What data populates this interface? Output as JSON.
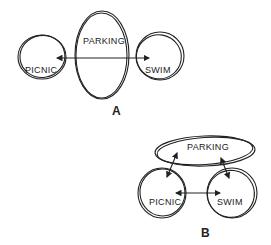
{
  "diagram_a": {
    "label": "A",
    "nodes": {
      "picnic": "PICNIC",
      "parking": "PARKING",
      "swim": "SWIM"
    },
    "connections": [
      {
        "from": "picnic",
        "to": "swim",
        "type": "bidirectional",
        "through": "parking"
      }
    ]
  },
  "diagram_b": {
    "label": "B",
    "nodes": {
      "picnic": "PICNIC",
      "parking": "PARKING",
      "swim": "SWIM"
    },
    "connections": [
      {
        "from": "picnic",
        "to": "parking",
        "type": "bidirectional"
      },
      {
        "from": "swim",
        "to": "parking",
        "type": "bidirectional"
      },
      {
        "from": "picnic",
        "to": "swim",
        "type": "bidirectional"
      }
    ]
  },
  "colors": {
    "ink": "#222222",
    "background": "#ffffff"
  }
}
